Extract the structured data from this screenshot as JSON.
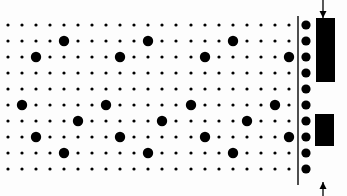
{
  "diagram": {
    "width": 347,
    "height": 196,
    "background": "#fdfdfd",
    "ink": "#000000",
    "line_color": "#222222",
    "grid": {
      "columns_x": [
        8,
        22,
        36,
        50,
        64,
        78,
        92,
        106,
        120,
        134,
        148,
        162,
        176,
        191,
        205,
        219,
        233,
        247,
        261,
        275,
        289
      ],
      "rows_y": [
        25,
        41,
        57,
        73,
        89,
        105,
        121,
        137,
        153,
        169
      ],
      "small_dot_radius": 1.6,
      "large_dot_radius": 5.2
    },
    "large_dots": [
      {
        "x": 64,
        "y": 41
      },
      {
        "x": 148,
        "y": 41
      },
      {
        "x": 233,
        "y": 41
      },
      {
        "x": 36,
        "y": 57
      },
      {
        "x": 120,
        "y": 57
      },
      {
        "x": 205,
        "y": 57
      },
      {
        "x": 289,
        "y": 57
      },
      {
        "x": 22,
        "y": 105
      },
      {
        "x": 106,
        "y": 105
      },
      {
        "x": 191,
        "y": 105
      },
      {
        "x": 275,
        "y": 105
      },
      {
        "x": 78,
        "y": 121
      },
      {
        "x": 162,
        "y": 121
      },
      {
        "x": 247,
        "y": 121
      },
      {
        "x": 36,
        "y": 137
      },
      {
        "x": 120,
        "y": 137
      },
      {
        "x": 205,
        "y": 137
      },
      {
        "x": 289,
        "y": 137
      },
      {
        "x": 64,
        "y": 153
      },
      {
        "x": 148,
        "y": 153
      },
      {
        "x": 233,
        "y": 153
      }
    ],
    "divider": {
      "x": 298,
      "y1": 16,
      "y2": 185,
      "width": 1.6
    },
    "edge_column": {
      "x": 306,
      "radius": 4.6
    },
    "blocks": [
      {
        "name": "upper-block",
        "x": 316,
        "y": 18,
        "w": 19,
        "h": 64
      },
      {
        "name": "lower-block",
        "x": 315,
        "y": 114,
        "w": 19,
        "h": 32
      }
    ],
    "arrows": [
      {
        "name": "down-arrow",
        "x": 323,
        "y1": 0,
        "y2": 18,
        "direction": "down"
      },
      {
        "name": "up-arrow",
        "x": 323,
        "y1": 196,
        "y2": 182,
        "direction": "up"
      }
    ]
  }
}
